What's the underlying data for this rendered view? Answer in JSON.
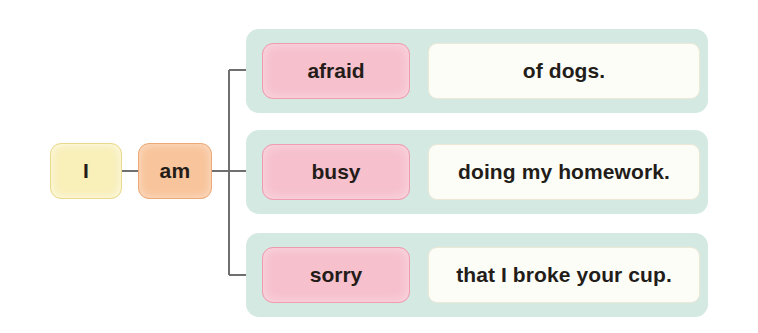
{
  "diagram": {
    "type": "sentence-pattern-tree",
    "subject": {
      "label": "I"
    },
    "verb": {
      "label": "am"
    },
    "colors": {
      "subject_fill": "#f8efb9",
      "verb_fill": "#f8c49b",
      "adjective_fill": "#f6c0cd",
      "band_fill": "#d3e9e2",
      "complement_fill": "#fdfdf8",
      "connector_line": "#6f6f6f"
    },
    "branches": [
      {
        "adjective": "afraid",
        "complement": "of dogs."
      },
      {
        "adjective": "busy",
        "complement": "doing my homework."
      },
      {
        "adjective": "sorry",
        "complement": "that I broke your cup."
      }
    ]
  }
}
